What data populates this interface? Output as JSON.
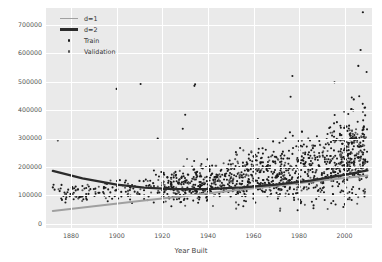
{
  "chart_data": {
    "type": "scatter",
    "title": "",
    "xlabel": "Year Built",
    "ylabel": "Sale Price",
    "xlim": [
      1869,
      2012
    ],
    "ylim": [
      -15000,
      760000
    ],
    "xticks": [
      1880,
      1900,
      1920,
      1940,
      1960,
      1980,
      2000
    ],
    "yticks": [
      0,
      100000,
      200000,
      300000,
      400000,
      500000,
      600000,
      700000
    ],
    "xtick_labels": [
      "1880",
      "1900",
      "1920",
      "1940",
      "1960",
      "1980",
      "2000"
    ],
    "ytick_labels": [
      "0",
      "100000",
      "200000",
      "300000",
      "400000",
      "500000",
      "600000",
      "700000"
    ],
    "grid": true,
    "grid_color": "#ffffff",
    "axes_facecolor": "#eaeaea",
    "legend_position": "upper left",
    "legend_entries": [
      {
        "label": "d=1",
        "kind": "line",
        "color": "#a0a0a0",
        "linewidth": 2.2
      },
      {
        "label": "d=2",
        "kind": "line",
        "color": "#2b2b2b",
        "linewidth": 2.6
      },
      {
        "label": "Train",
        "kind": "marker",
        "color": "#1a1a1a",
        "size": 2.4
      },
      {
        "label": "Validation",
        "kind": "marker",
        "color": "#555555",
        "size": 2.4
      }
    ],
    "series": [
      {
        "name": "d=1",
        "type": "line",
        "color": "#a0a0a0",
        "x": [
          1872,
          1890,
          1910,
          1930,
          1950,
          1970,
          1990,
          2010
        ],
        "y": [
          45000,
          62000,
          80000,
          98000,
          116000,
          134000,
          152000,
          170000
        ]
      },
      {
        "name": "d=2",
        "type": "line",
        "color": "#2b2b2b",
        "x": [
          1872,
          1885,
          1900,
          1912,
          1925,
          1940,
          1955,
          1970,
          1985,
          2000,
          2010
        ],
        "y": [
          186000,
          160000,
          138000,
          127000,
          122000,
          122000,
          128000,
          138000,
          152000,
          172000,
          188000
        ]
      },
      {
        "name": "Train",
        "type": "scatter",
        "color": "#1a1a1a",
        "marker": "o",
        "size": 2.0,
        "n_points": 960
      },
      {
        "name": "Validation",
        "type": "scatter",
        "color": "#555555",
        "marker": "o",
        "size": 2.0,
        "n_points": 250
      }
    ],
    "points": {
      "train": [
        [
          1872,
          128000
        ],
        [
          1875,
          115000
        ],
        [
          1880,
          104000
        ],
        [
          1882,
          131000
        ],
        [
          1885,
          96000
        ],
        [
          1890,
          122000
        ],
        [
          1892,
          109000
        ],
        [
          1895,
          142000
        ],
        [
          1898,
          88000
        ],
        [
          1900,
          118000
        ],
        [
          1900,
          475000
        ],
        [
          1902,
          112000
        ],
        [
          1904,
          152000
        ],
        [
          1905,
          98000
        ],
        [
          1906,
          127000
        ],
        [
          1908,
          132000
        ],
        [
          1910,
          104000
        ],
        [
          1910,
          151000
        ],
        [
          1912,
          118000
        ],
        [
          1914,
          96000
        ],
        [
          1915,
          126000
        ],
        [
          1916,
          143000
        ],
        [
          1918,
          109000
        ],
        [
          1918,
          300000
        ],
        [
          1920,
          118000
        ],
        [
          1920,
          98000
        ],
        [
          1920,
          135000
        ],
        [
          1921,
          112000
        ],
        [
          1922,
          127000
        ],
        [
          1923,
          91000
        ],
        [
          1924,
          133000
        ],
        [
          1925,
          118000
        ],
        [
          1925,
          163000
        ],
        [
          1926,
          105000
        ],
        [
          1927,
          142000
        ],
        [
          1928,
          96000
        ],
        [
          1929,
          121000
        ],
        [
          1930,
          110000
        ],
        [
          1930,
          147000
        ],
        [
          1931,
          88000
        ],
        [
          1932,
          119000
        ],
        [
          1934,
          127000
        ],
        [
          1935,
          104000
        ],
        [
          1935,
          172000
        ],
        [
          1936,
          95000
        ],
        [
          1937,
          134000
        ],
        [
          1938,
          111000
        ],
        [
          1939,
          122000
        ],
        [
          1940,
          99000
        ],
        [
          1940,
          139000
        ],
        [
          1941,
          116000
        ],
        [
          1942,
          128000
        ],
        [
          1945,
          106000
        ],
        [
          1946,
          131000
        ],
        [
          1947,
          118000
        ],
        [
          1948,
          124000
        ],
        [
          1949,
          112000
        ],
        [
          1950,
          128000
        ],
        [
          1950,
          96000
        ],
        [
          1950,
          160000
        ],
        [
          1951,
          119000
        ],
        [
          1952,
          134000
        ],
        [
          1953,
          108000
        ],
        [
          1954,
          141000
        ],
        [
          1955,
          122000
        ],
        [
          1955,
          98000
        ],
        [
          1956,
          131000
        ],
        [
          1957,
          115000
        ],
        [
          1958,
          147000
        ],
        [
          1959,
          126000
        ],
        [
          1960,
          133000
        ],
        [
          1960,
          105000
        ],
        [
          1961,
          152000
        ],
        [
          1962,
          121000
        ],
        [
          1963,
          138000
        ],
        [
          1964,
          128000
        ],
        [
          1965,
          144000
        ],
        [
          1965,
          112000
        ],
        [
          1966,
          156000
        ],
        [
          1967,
          131000
        ],
        [
          1968,
          148000
        ],
        [
          1969,
          125000
        ],
        [
          1970,
          139000
        ],
        [
          1970,
          168000
        ],
        [
          1971,
          121000
        ],
        [
          1972,
          152000
        ],
        [
          1973,
          134000
        ],
        [
          1974,
          159000
        ],
        [
          1975,
          142000
        ],
        [
          1976,
          128000
        ],
        [
          1977,
          163000
        ],
        [
          1978,
          146000
        ],
        [
          1979,
          151000
        ],
        [
          1980,
          138000
        ],
        [
          1980,
          175000
        ],
        [
          1982,
          154000
        ],
        [
          1984,
          168000
        ],
        [
          1985,
          147000
        ],
        [
          1986,
          182000
        ],
        [
          1988,
          159000
        ],
        [
          1990,
          172000
        ],
        [
          1992,
          164000
        ],
        [
          1993,
          195000
        ],
        [
          1994,
          178000
        ],
        [
          1995,
          186000
        ],
        [
          1996,
          171000
        ],
        [
          1997,
          198000
        ],
        [
          1998,
          184000
        ],
        [
          1999,
          205000
        ],
        [
          2000,
          192000
        ],
        [
          2001,
          214000
        ],
        [
          2002,
          198000
        ],
        [
          2003,
          228000
        ],
        [
          2004,
          212000
        ],
        [
          2005,
          241000
        ],
        [
          2005,
          178000
        ],
        [
          2006,
          232000
        ],
        [
          2006,
          186000
        ],
        [
          2007,
          258000
        ],
        [
          2007,
          198000
        ],
        [
          2007,
          612000
        ],
        [
          2008,
          244000
        ],
        [
          2008,
          205000
        ],
        [
          2008,
          745000
        ],
        [
          2009,
          226000
        ],
        [
          2009,
          382000
        ],
        [
          2010,
          218000
        ],
        [
          2006,
          556000
        ],
        [
          2004,
          438000
        ],
        [
          2003,
          404000
        ],
        [
          1998,
          312000
        ],
        [
          1994,
          288000
        ],
        [
          1976,
          322000
        ],
        [
          1964,
          266000
        ],
        [
          1958,
          244000
        ]
      ],
      "validation": [
        [
          1885,
          118000
        ],
        [
          1905,
          106000
        ],
        [
          1915,
          132000
        ],
        [
          1925,
          109000
        ],
        [
          1940,
          127000
        ],
        [
          1955,
          118000
        ],
        [
          1965,
          139000
        ],
        [
          1975,
          148000
        ],
        [
          1985,
          162000
        ],
        [
          1995,
          188000
        ],
        [
          2002,
          208000
        ],
        [
          2006,
          246000
        ],
        [
          2008,
          278000
        ],
        [
          2009,
          214000
        ],
        [
          2005,
          196000
        ]
      ]
    }
  }
}
